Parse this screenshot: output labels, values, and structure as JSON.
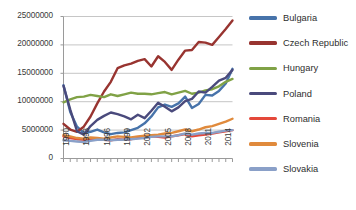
{
  "chart_data": {
    "type": "line",
    "title": "",
    "xlabel": "",
    "ylabel": "",
    "grid": true,
    "legend_position": "right",
    "x": [
      1990,
      1991,
      1992,
      1993,
      1994,
      1995,
      1996,
      1997,
      1998,
      1999,
      2000,
      2001,
      2002,
      2003,
      2004,
      2005,
      2006,
      2007,
      2008,
      2009,
      2010,
      2011,
      2012,
      2013,
      2014,
      2015
    ],
    "xtick_labels": [
      "1990",
      "1993",
      "1996",
      "1999",
      "2002",
      "2005",
      "2008",
      "2011",
      "2014"
    ],
    "xticks": [
      1990,
      1993,
      1996,
      1999,
      2002,
      2005,
      2008,
      2011,
      2014
    ],
    "ytick_labels": [
      "0",
      "5000000",
      "10000000",
      "15000000",
      "20000000",
      "25000000"
    ],
    "yticks": [
      0,
      5000000,
      10000000,
      15000000,
      20000000,
      25000000
    ],
    "ylim": [
      0,
      25000000
    ],
    "xlim": [
      1990,
      2015
    ],
    "series": [
      {
        "name": "Bulgaria",
        "color": "#4773aa",
        "values": [
          12900000,
          8200000,
          5600000,
          4500000,
          4700000,
          5100000,
          4600000,
          4300000,
          4500000,
          4600000,
          5000000,
          5400000,
          6200000,
          7400000,
          9000000,
          9500000,
          9100000,
          9700000,
          10900000,
          8900000,
          9600000,
          11200000,
          11100000,
          11900000,
          13200000,
          15800000
        ]
      },
      {
        "name": "Czech Republic",
        "color": "#983430",
        "values": [
          6100000,
          5100000,
          4700000,
          5600000,
          7400000,
          9700000,
          11800000,
          13500000,
          15900000,
          16400000,
          16700000,
          17200000,
          17500000,
          16200000,
          18000000,
          17000000,
          15600000,
          17400000,
          19000000,
          19100000,
          20500000,
          20400000,
          20000000,
          21400000,
          22800000,
          24300000
        ]
      },
      {
        "name": "Hungary",
        "color": "#80a246",
        "values": [
          9900000,
          10400000,
          10800000,
          10900000,
          11200000,
          11000000,
          10800000,
          11300000,
          11000000,
          11300000,
          11600000,
          11400000,
          11400000,
          11300000,
          11500000,
          11700000,
          11300000,
          11600000,
          11900000,
          11400000,
          11600000,
          12000000,
          12200000,
          12700000,
          13500000,
          14000000
        ]
      },
      {
        "name": "Poland",
        "color": "#4a4a7c",
        "values": [
          12800000,
          8600000,
          4800000,
          4200000,
          5700000,
          6800000,
          7500000,
          8100000,
          7800000,
          7400000,
          6900000,
          7700000,
          7100000,
          8400000,
          9800000,
          9100000,
          8300000,
          9000000,
          10100000,
          10500000,
          11800000,
          11600000,
          12600000,
          13700000,
          14200000,
          15600000
        ]
      },
      {
        "name": "Romania",
        "color": "#e4483a",
        "values": [
          3900000,
          3600000,
          3400000,
          3300000,
          3500000,
          3400000,
          3300000,
          3200000,
          3400000,
          3300000,
          3400000,
          3600000,
          3700000,
          3900000,
          3800000,
          3700000,
          3900000,
          4100000,
          4300000,
          3900000,
          4100000,
          4200000,
          4400000,
          4600000,
          4800000,
          5000000
        ]
      },
      {
        "name": "Slovenia",
        "color": "#e08a3c",
        "values": [
          4100000,
          3900000,
          3600000,
          3500000,
          3700000,
          3600000,
          3500000,
          3700000,
          3900000,
          3800000,
          3700000,
          3900000,
          4000000,
          4100000,
          4200000,
          4400000,
          4500000,
          4800000,
          5100000,
          4800000,
          5100000,
          5500000,
          5700000,
          6100000,
          6500000,
          7000000
        ]
      },
      {
        "name": "Slovakia",
        "color": "#8aa0c8",
        "values": [
          3200000,
          3100000,
          3000000,
          2900000,
          3100000,
          3300000,
          3300000,
          3200000,
          3300000,
          3300000,
          3400000,
          3500000,
          3600000,
          3800000,
          3900000,
          3900000,
          3900000,
          4100000,
          4400000,
          4200000,
          4400000,
          4500000,
          4500000,
          4700000,
          4900000,
          5000000
        ]
      }
    ]
  },
  "legend": {
    "items": [
      {
        "label": "Bulgaria"
      },
      {
        "label": "Czech Republic"
      },
      {
        "label": "Hungary"
      },
      {
        "label": "Poland"
      },
      {
        "label": "Romania"
      },
      {
        "label": "Slovenia"
      },
      {
        "label": "Slovakia"
      }
    ]
  },
  "colors": {
    "background": "#ffffff",
    "grid": "#bfbfbf",
    "axis": "#9a9a9a",
    "tick_text": "#3a3a3a"
  }
}
